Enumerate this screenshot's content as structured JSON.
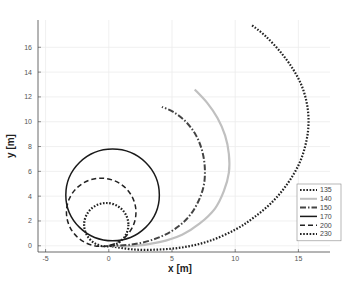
{
  "chart_data": {
    "type": "line",
    "title": "",
    "xlabel": "x [m]",
    "ylabel": "y [m]",
    "xlim": [
      -5.6,
      17.5
    ],
    "ylim": [
      -0.5,
      18.2
    ],
    "xticks": [
      -5,
      0,
      5,
      10,
      15
    ],
    "yticks": [
      0,
      2,
      4,
      6,
      8,
      10,
      12,
      14,
      16
    ],
    "grid": true,
    "legend_position": "lower right",
    "series": [
      {
        "name": "135",
        "style": "dotted",
        "color": "#222222",
        "width": 2.2,
        "x": [
          0,
          2,
          4,
          6,
          8,
          10,
          11.5,
          13,
          14.2,
          15.1,
          15.6,
          15.8,
          15.7,
          15.3,
          14.6,
          13.6,
          12.4,
          11.3
        ],
        "y": [
          0,
          -0.3,
          -0.3,
          -0.1,
          0.4,
          1.3,
          2.3,
          3.6,
          5.1,
          6.7,
          8.3,
          9.8,
          11.3,
          12.8,
          14.2,
          15.6,
          16.9,
          17.8
        ]
      },
      {
        "name": "140",
        "style": "solid",
        "color": "#c0c0c0",
        "width": 2.2,
        "x": [
          0,
          2,
          4,
          5.8,
          7.2,
          8.4,
          9.1,
          9.5,
          9.5,
          9.2,
          8.6,
          7.8,
          6.8
        ],
        "y": [
          0,
          0,
          0.3,
          0.9,
          1.8,
          3.0,
          4.4,
          5.9,
          7.4,
          8.9,
          10.3,
          11.5,
          12.6
        ]
      },
      {
        "name": "150",
        "style": "dashdot",
        "color": "#444444",
        "width": 2,
        "x": [
          0,
          1.8,
          3.5,
          5.0,
          6.2,
          7.0,
          7.5,
          7.6,
          7.4,
          6.9,
          6.1,
          5.1,
          4.2
        ],
        "y": [
          0,
          0.1,
          0.5,
          1.2,
          2.2,
          3.4,
          4.8,
          6.2,
          7.6,
          8.9,
          10.0,
          10.8,
          11.2
        ]
      },
      {
        "name": "170",
        "style": "solid",
        "color": "#1a1a1a",
        "width": 1.5,
        "circle": {
          "cx": 0.3,
          "cy": 4.1,
          "r": 3.7
        }
      },
      {
        "name": "200",
        "style": "dashed",
        "color": "#222222",
        "width": 1.5,
        "circle": {
          "cx": -0.6,
          "cy": 2.7,
          "r": 2.75
        }
      },
      {
        "name": "230",
        "style": "dotted",
        "color": "#222222",
        "width": 2.2,
        "circle": {
          "cx": -0.2,
          "cy": 1.7,
          "r": 1.75
        }
      }
    ]
  }
}
